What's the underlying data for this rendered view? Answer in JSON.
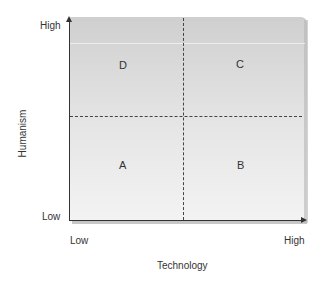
{
  "diagram": {
    "type": "quadrant",
    "x_axis": {
      "title": "Technology",
      "low_label": "Low",
      "high_label": "High"
    },
    "y_axis": {
      "title": "Humanism",
      "low_label": "Low",
      "high_label": "High"
    },
    "quadrants": {
      "top_left": "D",
      "top_right": "C",
      "bottom_left": "A",
      "bottom_right": "B"
    },
    "colors": {
      "panel_top": "#cfcfcf",
      "panel_bottom": "#f3f3f3",
      "axis": "#333333",
      "divider": "#444444"
    }
  }
}
